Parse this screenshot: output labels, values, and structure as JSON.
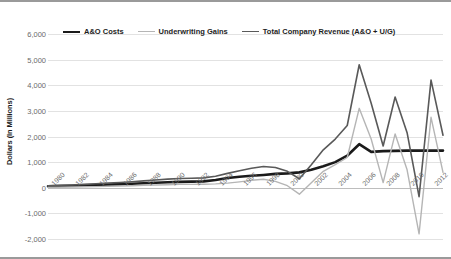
{
  "chart_data": {
    "type": "line",
    "title": "",
    "xlabel": "",
    "ylabel": "Dollars (In Millions)",
    "ylim": [
      -2000,
      6000
    ],
    "ytick_values": [
      6000,
      5000,
      4000,
      3000,
      2000,
      1000,
      0,
      -1000,
      -2000
    ],
    "ytick_labels": [
      "6,000",
      "5,000",
      "4,000",
      "3,000",
      "2,000",
      "1,000",
      "0",
      "-1,000",
      "-2,000"
    ],
    "grid": true,
    "legend_position": "top",
    "x": [
      1980,
      1981,
      1982,
      1983,
      1984,
      1985,
      1986,
      1987,
      1988,
      1989,
      1990,
      1991,
      1992,
      1993,
      1994,
      1995,
      1996,
      1997,
      1998,
      1999,
      2000,
      2001,
      2002,
      2003,
      2004,
      2005,
      2006,
      2007,
      2008,
      2009,
      2010,
      2011,
      2012,
      2013
    ],
    "xtick_labels": [
      "1980",
      "1982",
      "1984",
      "1986",
      "1988",
      "1990",
      "1992",
      "1994",
      "1996",
      "1998",
      "2000",
      "2002",
      "2004",
      "2006",
      "2008",
      "2010",
      "2012"
    ],
    "series": [
      {
        "name": "A&O Costs",
        "color": "#1a1a1a",
        "width": 2.6,
        "values": [
          60,
          70,
          80,
          95,
          110,
          125,
          140,
          155,
          175,
          195,
          215,
          230,
          240,
          250,
          300,
          380,
          430,
          470,
          500,
          540,
          560,
          600,
          700,
          840,
          1000,
          1250,
          1700,
          1400,
          1430,
          1440,
          1450,
          1450,
          1450,
          1450
        ]
      },
      {
        "name": "Underwriting Gains",
        "color": "#b5b5b5",
        "width": 1.4,
        "values": [
          20,
          25,
          30,
          35,
          45,
          55,
          65,
          80,
          95,
          110,
          120,
          130,
          130,
          135,
          150,
          180,
          230,
          290,
          330,
          250,
          80,
          -250,
          200,
          640,
          900,
          1180,
          3100,
          1900,
          200,
          2100,
          700,
          -1800,
          2750,
          600
        ]
      },
      {
        "name": "Total Company Revenue (A&O + U/G)",
        "color": "#595959",
        "width": 1.6,
        "values": [
          80,
          95,
          110,
          130,
          155,
          180,
          205,
          235,
          270,
          305,
          335,
          360,
          370,
          385,
          450,
          560,
          660,
          760,
          830,
          790,
          640,
          350,
          900,
          1480,
          1900,
          2430,
          4800,
          3300,
          1630,
          3540,
          2150,
          -350,
          4200,
          2050
        ]
      }
    ]
  },
  "legend": {
    "entries": [
      {
        "label": "A&O Costs"
      },
      {
        "label": "Underwriting Gains"
      },
      {
        "label": "Total Company Revenue (A&O + U/G)"
      }
    ]
  }
}
